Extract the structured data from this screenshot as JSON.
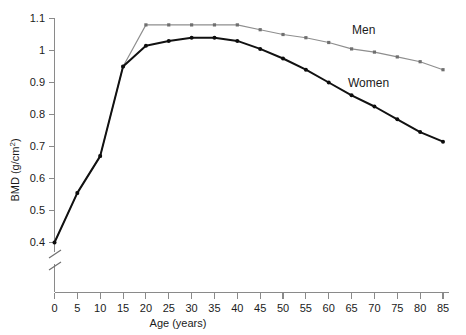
{
  "chart_data": {
    "type": "line",
    "title": "",
    "subtitle": "",
    "xlabel": "Age (years)",
    "ylabel": "BMD (g/cm2)",
    "ylabel_base": "BMD (g/cm",
    "ylabel_sup": "2",
    "ylabel_close": ")",
    "xlim": [
      0,
      85
    ],
    "ylim": [
      0.4,
      1.1
    ],
    "y_axis_break": true,
    "y_axis_break_note": "axis broken below 0.4",
    "grid": false,
    "legend_position": "inline-annotations",
    "xticks": [
      0,
      5,
      10,
      15,
      20,
      25,
      30,
      35,
      40,
      45,
      50,
      55,
      60,
      65,
      70,
      75,
      80,
      85
    ],
    "xticklabels": [
      "0",
      "5",
      "10",
      "15",
      "20",
      "25",
      "30",
      "35",
      "40",
      "45",
      "50",
      "55",
      "60",
      "65",
      "70",
      "75",
      "80",
      "85"
    ],
    "yticks": [
      0.4,
      0.5,
      0.6,
      0.7,
      0.8,
      0.9,
      1.0,
      1.1
    ],
    "yticklabels": [
      "0.4",
      "0.5",
      "0.6",
      "0.7",
      "0.8",
      "0.9",
      "1",
      "1.1"
    ],
    "x": [
      0,
      5,
      10,
      15,
      20,
      25,
      30,
      35,
      40,
      45,
      50,
      55,
      60,
      65,
      70,
      75,
      80,
      85
    ],
    "series": [
      {
        "name": "Men",
        "color": "#8e8e8e",
        "label_text": "Men",
        "values": [
          0.4,
          0.555,
          0.67,
          0.95,
          1.08,
          1.08,
          1.08,
          1.08,
          1.08,
          1.065,
          1.05,
          1.04,
          1.025,
          1.005,
          0.995,
          0.98,
          0.965,
          0.94
        ]
      },
      {
        "name": "Women",
        "color": "#111111",
        "label_text": "Women",
        "values": [
          0.4,
          0.555,
          0.67,
          0.95,
          1.015,
          1.03,
          1.04,
          1.04,
          1.03,
          1.005,
          0.975,
          0.94,
          0.9,
          0.86,
          0.825,
          0.785,
          0.745,
          0.715
        ]
      }
    ],
    "annotations": [
      {
        "text": "Men",
        "x_px": 352,
        "y_px": 34
      },
      {
        "text": "Women",
        "x_px": 348,
        "y_px": 87
      }
    ]
  }
}
